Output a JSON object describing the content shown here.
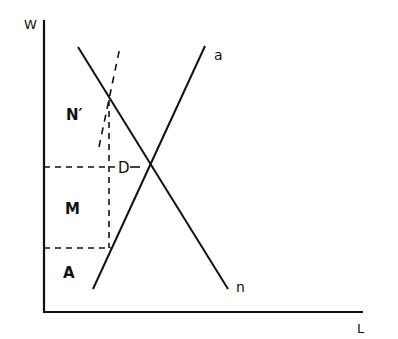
{
  "diagram": {
    "axes": {
      "y_label": "W",
      "x_label": "L"
    },
    "curves": {
      "demand": {
        "label": "n",
        "style": "solid"
      },
      "supply": {
        "label": "a",
        "style": "solid"
      },
      "shifted": {
        "label": "",
        "style": "dashed"
      }
    },
    "points": {
      "equilibrium": {
        "label": "D"
      }
    },
    "regions": {
      "upper": {
        "label": "N′"
      },
      "middle": {
        "label": "M"
      },
      "lower": {
        "label": "A"
      }
    },
    "colors": {
      "line": "#111111",
      "background": "#ffffff"
    }
  }
}
